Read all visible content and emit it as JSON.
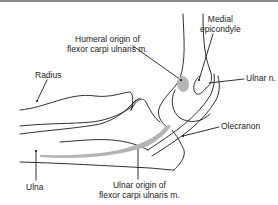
{
  "figure": {
    "colors": {
      "line": "#1a1a1a",
      "muscle_origin": "#b5b5b5",
      "top_rule": "#8a8a8a"
    }
  },
  "labels": {
    "humeral_origin": {
      "line1": "Humeral origin of",
      "line2": "flexor carpi ulnaris m."
    },
    "medial_epicondyle": {
      "line1": "Medial",
      "line2": "epicondyle"
    },
    "radius": "Radius",
    "ulnar_nerve": "Ulnar n.",
    "olecranon": "Olecranon",
    "ulna": "Ulna",
    "ulnar_origin": {
      "line1": "Ulnar origin of",
      "line2": "flexor carpi ulnaris m."
    }
  }
}
